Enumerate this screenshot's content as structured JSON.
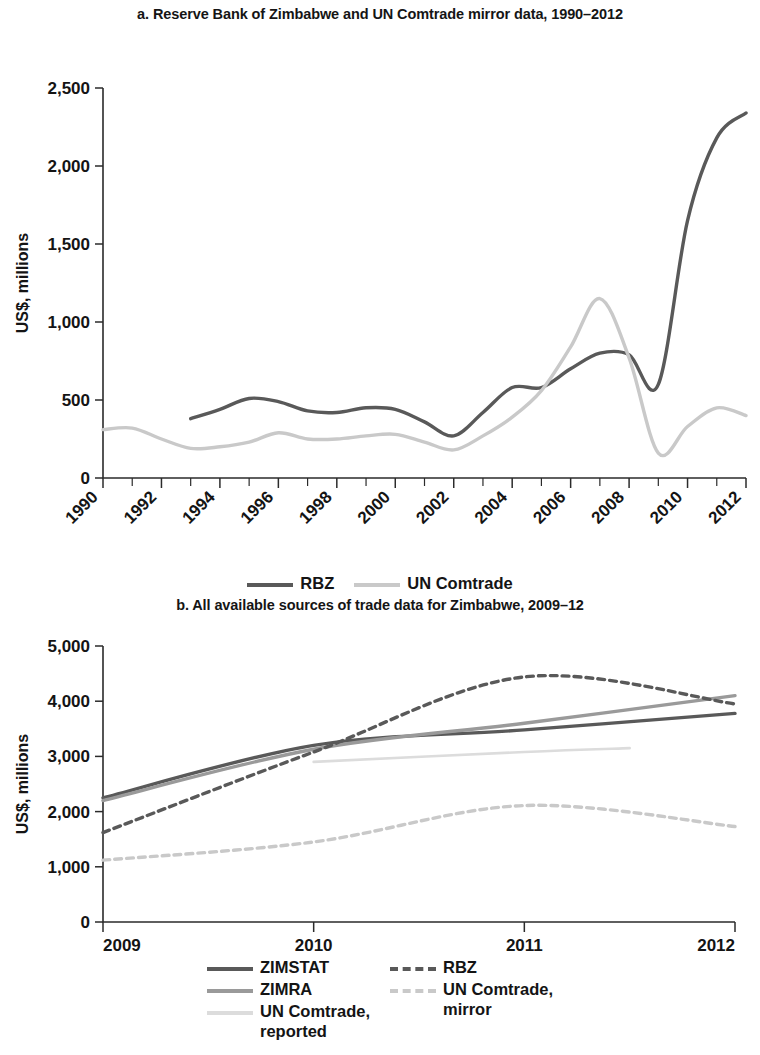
{
  "colors": {
    "dark": "#595959",
    "mid": "#9a9a9a",
    "light": "#c9c9c9",
    "pale": "#dcdcdc",
    "axis": "#2b2b2b",
    "text": "#141414"
  },
  "panel_a": {
    "title": "a. Reserve Bank of Zimbabwe and UN Comtrade mirror data, 1990–2012",
    "ylabel": "US$, millions",
    "ytick_labels": [
      "0",
      "500",
      "1,000",
      "1,500",
      "2,000",
      "2,500"
    ],
    "xtick_labels": [
      "1990",
      "1992",
      "1994",
      "1996",
      "1998",
      "2000",
      "2002",
      "2004",
      "2006",
      "2008",
      "2010",
      "2012"
    ],
    "legend": [
      {
        "label": "RBZ",
        "color": "#595959",
        "dash": "none"
      },
      {
        "label": "UN Comtrade",
        "color": "#c9c9c9",
        "dash": "none"
      }
    ]
  },
  "panel_b": {
    "title": "b. All available sources of trade data for Zimbabwe, 2009–12",
    "ylabel": "US$, millions",
    "ytick_labels": [
      "0",
      "1,000",
      "2,000",
      "3,000",
      "4,000",
      "5,000"
    ],
    "xtick_labels": [
      "2009",
      "2010",
      "2011",
      "2012"
    ],
    "legend_left": [
      {
        "label": "ZIMSTAT",
        "color": "#595959",
        "dash": "none"
      },
      {
        "label": "ZIMRA",
        "color": "#9a9a9a",
        "dash": "none"
      },
      {
        "label": "UN Comtrade,\nreported",
        "color": "#dcdcdc",
        "dash": "none"
      }
    ],
    "legend_right": [
      {
        "label": "RBZ",
        "color": "#595959",
        "dash": "dashed"
      },
      {
        "label": "UN Comtrade,\nmirror",
        "color": "#c9c9c9",
        "dash": "dashed"
      }
    ]
  },
  "chart_data": [
    {
      "type": "line",
      "panel": "a",
      "title": "a. Reserve Bank of Zimbabwe and UN Comtrade mirror data, 1990–2012",
      "xlabel": "",
      "ylabel": "US$, millions",
      "xlim": [
        1990,
        2012
      ],
      "ylim": [
        0,
        2500
      ],
      "yticks": [
        0,
        500,
        1000,
        1500,
        2000,
        2500
      ],
      "xticks": [
        1990,
        1992,
        1994,
        1996,
        1998,
        2000,
        2002,
        2004,
        2006,
        2008,
        2010,
        2012
      ],
      "xtick_minor_every": 1,
      "grid": false,
      "legend_position": "bottom-center",
      "series": [
        {
          "name": "RBZ",
          "color": "#595959",
          "dash": "none",
          "x": [
            1993,
            1994,
            1995,
            1996,
            1997,
            1998,
            1999,
            2000,
            2001,
            2002,
            2003,
            2004,
            2005,
            2006,
            2007,
            2008,
            2009,
            2010,
            2011,
            2012
          ],
          "values": [
            380,
            440,
            510,
            490,
            430,
            420,
            450,
            440,
            360,
            270,
            420,
            580,
            580,
            700,
            800,
            790,
            600,
            1650,
            2180,
            2340
          ]
        },
        {
          "name": "UN Comtrade",
          "color": "#c9c9c9",
          "dash": "none",
          "x": [
            1990,
            1991,
            1992,
            1993,
            1994,
            1995,
            1996,
            1997,
            1998,
            1999,
            2000,
            2001,
            2002,
            2003,
            2004,
            2005,
            2006,
            2007,
            2008,
            2009,
            2010,
            2011,
            2012
          ],
          "values": [
            310,
            320,
            250,
            190,
            200,
            230,
            290,
            250,
            250,
            270,
            280,
            230,
            180,
            270,
            390,
            560,
            840,
            1150,
            770,
            160,
            330,
            450,
            400
          ]
        }
      ]
    },
    {
      "type": "line",
      "panel": "b",
      "title": "b. All available sources of trade data for Zimbabwe, 2009–12",
      "xlabel": "",
      "ylabel": "US$, millions",
      "xlim": [
        2009,
        2012
      ],
      "ylim": [
        0,
        5000
      ],
      "yticks": [
        0,
        1000,
        2000,
        3000,
        4000,
        5000
      ],
      "xticks": [
        2009,
        2010,
        2011,
        2012
      ],
      "grid": false,
      "legend_position": "bottom-center",
      "series": [
        {
          "name": "ZIMSTAT",
          "color": "#595959",
          "dash": "none",
          "x": [
            2009,
            2010,
            2011,
            2012
          ],
          "values": [
            2250,
            3200,
            3480,
            3780
          ]
        },
        {
          "name": "ZIMRA",
          "color": "#9a9a9a",
          "dash": "none",
          "x": [
            2009,
            2010,
            2011,
            2012
          ],
          "values": [
            2200,
            3130,
            3600,
            4100
          ]
        },
        {
          "name": "UN Comtrade, reported",
          "color": "#dcdcdc",
          "dash": "none",
          "x": [
            2010,
            2011,
            2011.5
          ],
          "values": [
            2900,
            3080,
            3150
          ]
        },
        {
          "name": "RBZ",
          "color": "#595959",
          "dash": "dashed",
          "x": [
            2009,
            2010,
            2011,
            2012
          ],
          "values": [
            1620,
            3080,
            4440,
            3950
          ]
        },
        {
          "name": "UN Comtrade, mirror",
          "color": "#c9c9c9",
          "dash": "dashed",
          "x": [
            2009,
            2010,
            2011,
            2012
          ],
          "values": [
            1120,
            1450,
            2110,
            1730
          ]
        }
      ]
    }
  ]
}
